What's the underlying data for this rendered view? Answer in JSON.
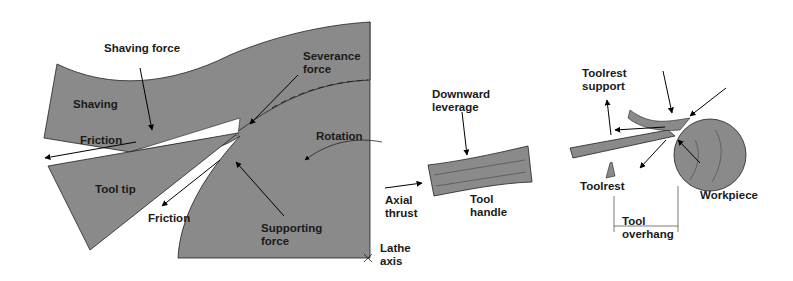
{
  "colors": {
    "fill": "#8a8a8a",
    "stroke": "#222222",
    "arrow": "#000000",
    "background": "#ffffff",
    "text": "#1a1a1a"
  },
  "panels": {
    "cutting_zone": {
      "labels": {
        "shaving_force": "Shaving force",
        "severance_force": "Severance\nforce",
        "shaving": "Shaving",
        "friction_top": "Friction",
        "rotation": "Rotation",
        "tool_tip": "Tool tip",
        "friction_bottom": "Friction",
        "supporting_force": "Supporting\nforce",
        "lathe_axis": "Lathe\naxis"
      }
    },
    "tool_handle": {
      "labels": {
        "downward_leverage": "Downward\nleverage",
        "axial_thrust": "Axial\nthrust",
        "tool_handle": "Tool\nhandle"
      }
    },
    "overview": {
      "labels": {
        "toolrest_support": "Toolrest\nsupport",
        "toolrest": "Toolrest",
        "workpiece": "Workpiece",
        "tool_overhang": "Tool\noverhang"
      }
    }
  }
}
